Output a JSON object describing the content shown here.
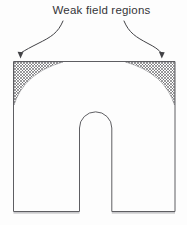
{
  "figure": {
    "caption": "Weak field regions",
    "colors": {
      "bg": "#fdfdfd",
      "line": "#5e5e62",
      "hatch": "#48484c",
      "text": "#343438",
      "arrow": "#424246",
      "shadow": "#b7b7ba"
    }
  }
}
